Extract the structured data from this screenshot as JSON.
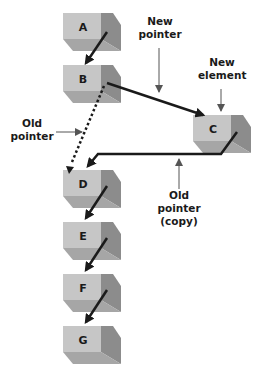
{
  "diagram": {
    "type": "linked-list-insertion",
    "nodes": [
      {
        "id": "A",
        "label": "A"
      },
      {
        "id": "B",
        "label": "B"
      },
      {
        "id": "C",
        "label": "C"
      },
      {
        "id": "D",
        "label": "D"
      },
      {
        "id": "E",
        "label": "E"
      },
      {
        "id": "F",
        "label": "F"
      },
      {
        "id": "G",
        "label": "G"
      }
    ],
    "edges": [
      {
        "from": "A",
        "to": "B",
        "style": "solid"
      },
      {
        "from": "B",
        "to": "C",
        "style": "solid",
        "annotation": "New pointer"
      },
      {
        "from": "B",
        "to": "D",
        "style": "dotted",
        "annotation": "Old pointer"
      },
      {
        "from": "C",
        "to": "D",
        "style": "solid",
        "annotation": "Old pointer (copy)"
      },
      {
        "from": "D",
        "to": "E",
        "style": "solid"
      },
      {
        "from": "E",
        "to": "F",
        "style": "solid"
      },
      {
        "from": "F",
        "to": "G",
        "style": "solid"
      }
    ],
    "annotations": {
      "new_pointer_line1": "New",
      "new_pointer_line2": "pointer",
      "new_element_line1": "New",
      "new_element_line2": "element",
      "old_pointer_line1": "Old",
      "old_pointer_line2": "pointer",
      "old_copy_line1": "Old",
      "old_copy_line2": "pointer",
      "old_copy_line3": "(copy)"
    },
    "colors": {
      "box_front": "#c4c4c4",
      "box_side": "#8e8e8e",
      "box_bottom": "#a8a8a8",
      "arrow": "#1a1a1a",
      "callout": "#555555"
    }
  }
}
